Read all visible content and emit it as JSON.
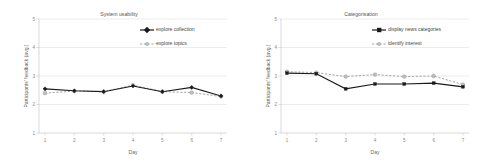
{
  "figure": {
    "panel_count": 2
  },
  "chart_data": [
    {
      "type": "line",
      "title": "System usability",
      "xlabel": "Day",
      "ylabel": "Participants' feedback (avg.)",
      "categories": [
        "1",
        "2",
        "3",
        "4",
        "5",
        "6",
        "7"
      ],
      "x": [
        1,
        2,
        3,
        4,
        5,
        6,
        7
      ],
      "xlim": [
        1,
        7
      ],
      "ylim": [
        1,
        5
      ],
      "yticks": [
        "1",
        "2",
        "3",
        "4",
        "5"
      ],
      "ytick_values": [
        1,
        2,
        3,
        4,
        5
      ],
      "grid": true,
      "legend_position": "top-right",
      "series": [
        {
          "name": "explore collection",
          "style": "solid-black-diamond",
          "color": "#1a1a1a",
          "values": [
            2.55,
            2.48,
            2.45,
            2.65,
            2.45,
            2.6,
            2.3
          ]
        },
        {
          "name": "explore topics",
          "style": "dashed-grey-circle",
          "color": "#a6a6a6",
          "values": [
            2.4,
            2.47,
            2.45,
            2.68,
            2.45,
            2.42,
            2.28
          ]
        }
      ]
    },
    {
      "type": "line",
      "title": "Categorisation",
      "xlabel": "Day",
      "ylabel": "Participants' feedback (avg.)",
      "categories": [
        "1",
        "2",
        "3",
        "4",
        "5",
        "6",
        "7"
      ],
      "x": [
        1,
        2,
        3,
        4,
        5,
        6,
        7
      ],
      "xlim": [
        1,
        7
      ],
      "ylim": [
        1,
        5
      ],
      "yticks": [
        "1",
        "2",
        "3",
        "4",
        "5"
      ],
      "ytick_values": [
        1,
        2,
        3,
        4,
        5
      ],
      "grid": true,
      "legend_position": "top-right",
      "series": [
        {
          "name": "display news categories",
          "style": "solid-black-square",
          "color": "#1a1a1a",
          "values": [
            3.1,
            3.08,
            2.55,
            2.72,
            2.72,
            2.75,
            2.62
          ]
        },
        {
          "name": "identify interest",
          "style": "dashed-grey-circle",
          "color": "#a6a6a6",
          "values": [
            3.15,
            3.12,
            2.98,
            3.05,
            2.98,
            3.0,
            2.7
          ]
        }
      ]
    }
  ]
}
